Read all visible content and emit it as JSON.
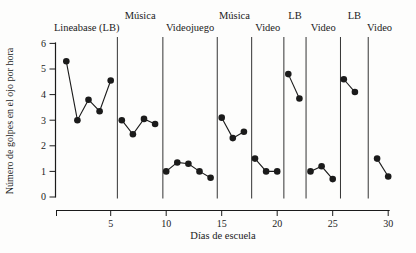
{
  "figure": {
    "background": "#fdfdfc",
    "ink_color": "#1b1b1b",
    "separator_color": "#343434",
    "marker": "filled-circle"
  },
  "chart_data": {
    "type": "line",
    "title": "",
    "xlabel": "Días de escuela",
    "ylabel": "Número de golpes en el ojo por hora",
    "xlim": [
      0,
      31
    ],
    "ylim": [
      0,
      6
    ],
    "x_ticks": [
      5,
      10,
      15,
      20,
      25,
      30
    ],
    "y_ticks": [
      0,
      1,
      2,
      3,
      4,
      5,
      6
    ],
    "grid": false,
    "legend": "none",
    "separators_at_day": [
      5.6,
      9.7,
      14.6,
      17.7,
      20.6,
      22.6,
      25.7,
      28.2
    ],
    "phases": [
      {
        "label": "Lineabase (LB)",
        "label_row": "lower",
        "points": [
          [
            1,
            5.3
          ],
          [
            2,
            3.0
          ],
          [
            3,
            3.8
          ],
          [
            4,
            3.35
          ],
          [
            5,
            4.55
          ]
        ]
      },
      {
        "label": "Música",
        "label_row": "upper",
        "points": [
          [
            6,
            3.0
          ],
          [
            7,
            2.45
          ],
          [
            8,
            3.05
          ],
          [
            9,
            2.85
          ]
        ]
      },
      {
        "label": "Videojuego",
        "label_row": "lower",
        "points": [
          [
            10,
            1.0
          ],
          [
            11,
            1.35
          ],
          [
            12,
            1.3
          ],
          [
            13,
            1.0
          ],
          [
            14,
            0.75
          ]
        ]
      },
      {
        "label": "Música",
        "label_row": "upper",
        "points": [
          [
            15,
            3.1
          ],
          [
            16,
            2.3
          ],
          [
            17,
            2.55
          ]
        ]
      },
      {
        "label": "Video",
        "label_row": "lower",
        "points": [
          [
            18,
            1.5
          ],
          [
            19,
            1.0
          ],
          [
            20,
            1.0
          ]
        ]
      },
      {
        "label": "LB",
        "label_row": "upper",
        "points": [
          [
            21,
            4.8
          ],
          [
            22,
            3.85
          ]
        ]
      },
      {
        "label": "Video",
        "label_row": "lower",
        "points": [
          [
            23,
            1.0
          ],
          [
            24,
            1.2
          ],
          [
            25,
            0.7
          ]
        ]
      },
      {
        "label": "LB",
        "label_row": "upper",
        "points": [
          [
            26,
            4.6
          ],
          [
            27,
            4.1
          ]
        ]
      },
      {
        "label": "Video",
        "label_row": "lower",
        "points": [
          [
            29,
            1.5
          ],
          [
            30,
            0.8
          ]
        ]
      }
    ]
  }
}
